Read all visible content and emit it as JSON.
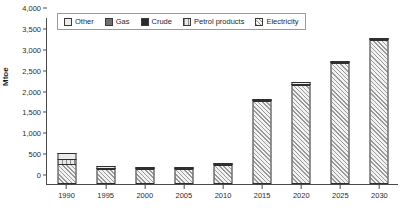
{
  "chart_data": {
    "type": "bar",
    "stacked": true,
    "title": "",
    "xlabel": "",
    "ylabel": "Mtoe",
    "ylim": [
      0,
      4000
    ],
    "ytick_values": [
      0,
      500,
      1000,
      1500,
      2000,
      2500,
      3000,
      3500,
      4000
    ],
    "ytick_labels": [
      "0",
      "500",
      "1,000",
      "1,500",
      "2,000",
      "2,500",
      "3,000",
      "3,500",
      "4,000"
    ],
    "categories": [
      "1990",
      "1995",
      "2000",
      "2005",
      "2010",
      "2015",
      "2020",
      "2025",
      "2030"
    ],
    "grid": false,
    "legend_position": "top",
    "series": [
      {
        "name": "Other",
        "key": "other",
        "swatch": "#ececec",
        "pattern": "solid",
        "values": [
          150,
          30,
          25,
          25,
          25,
          30,
          30,
          30,
          30
        ]
      },
      {
        "name": "Gas",
        "key": "gas",
        "swatch": "#6e6e6e",
        "pattern": "solid",
        "values": [
          0,
          0,
          0,
          0,
          0,
          0,
          0,
          0,
          0
        ]
      },
      {
        "name": "Crude",
        "key": "crude",
        "swatch": "#2a2a2a",
        "pattern": "solid",
        "values": [
          0,
          20,
          20,
          20,
          20,
          20,
          20,
          20,
          20
        ]
      },
      {
        "name": "Petrol products",
        "key": "petrol",
        "swatch": "#e8e8e8",
        "pattern": "vertical",
        "values": [
          110,
          0,
          0,
          0,
          0,
          0,
          0,
          0,
          0
        ]
      },
      {
        "name": "Electricity",
        "key": "electricity",
        "swatch": "#f2f2f2",
        "pattern": "diagonal",
        "values": [
          490,
          370,
          355,
          365,
          455,
          1980,
          2380,
          2900,
          3450
        ]
      }
    ],
    "totals": [
      750,
      420,
      400,
      410,
      500,
      2030,
      2430,
      2950,
      3500
    ]
  }
}
